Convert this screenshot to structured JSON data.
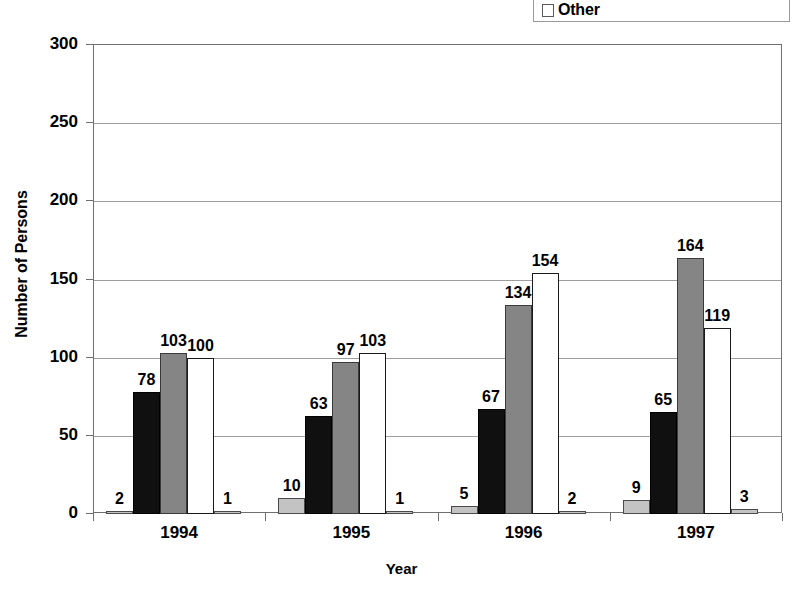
{
  "chart_data": {
    "type": "bar",
    "title": "",
    "xlabel": "Year",
    "ylabel": "Number of Persons",
    "categories": [
      "1994",
      "1995",
      "1996",
      "1997"
    ],
    "ylim": [
      0,
      300
    ],
    "yticks": [
      0,
      50,
      100,
      150,
      200,
      250,
      300
    ],
    "ytick_labels": [
      "0",
      "50",
      "100",
      "150",
      "200",
      "250",
      "300"
    ],
    "grid": true,
    "legend_position": "top-right",
    "legend_entries": [
      {
        "label": "Other",
        "color": "#c3c3c3",
        "swatch": "legend-swatch-other"
      }
    ],
    "series": [
      {
        "name": "series-1",
        "color": "#c3c3c3",
        "values": [
          2,
          10,
          5,
          9
        ]
      },
      {
        "name": "series-2",
        "color": "#101010",
        "values": [
          78,
          63,
          67,
          65
        ]
      },
      {
        "name": "series-3",
        "color": "#858585",
        "values": [
          103,
          97,
          134,
          164
        ]
      },
      {
        "name": "series-4",
        "color": "#ffffff",
        "values": [
          100,
          103,
          154,
          119
        ]
      },
      {
        "name": "series-5-other",
        "color": "#c3c3c3",
        "values": [
          1,
          1,
          2,
          3
        ]
      }
    ],
    "data_labels": [
      [
        "2",
        "78",
        "103",
        "100",
        "1"
      ],
      [
        "10",
        "63",
        "97",
        "103",
        "1"
      ],
      [
        "5",
        "67",
        "134",
        "154",
        "2"
      ],
      [
        "9",
        "65",
        "164",
        "119",
        "3"
      ]
    ]
  },
  "axes": {
    "y": {
      "title": "Number of Persons",
      "ticks": [
        "300",
        "250",
        "200",
        "150",
        "100",
        "50",
        "0"
      ]
    },
    "x": {
      "title": "Year",
      "ticks": [
        "1994",
        "1995",
        "1996",
        "1997"
      ]
    }
  },
  "legend": {
    "entries": [
      {
        "label": "Other"
      }
    ]
  }
}
